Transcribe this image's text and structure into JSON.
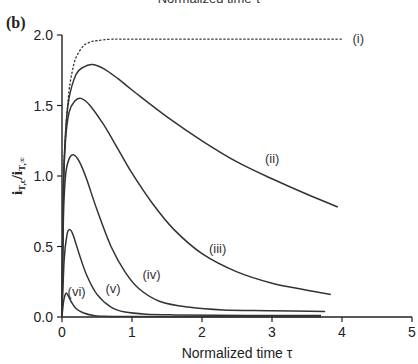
{
  "panel_label": "(b)",
  "top_cut_text": "Normalized time τ",
  "chart_data": {
    "type": "line",
    "title": "",
    "xlabel": "Normalized time τ",
    "ylabel": "i_T,c / i_T,∞",
    "xlim": [
      0,
      5
    ],
    "ylim": [
      0,
      2.0
    ],
    "xticks": [
      0,
      1,
      2,
      3,
      4,
      5
    ],
    "xtick_labels": [
      "0",
      "1",
      "2",
      "3",
      "4",
      "5"
    ],
    "yticks": [
      0.0,
      0.5,
      1.0,
      1.5,
      2.0
    ],
    "ytick_labels": [
      "0.0",
      "0.5",
      "1.0",
      "1.5",
      "2.0"
    ],
    "grid": false,
    "legend": "inline labels",
    "series": [
      {
        "name": "(i)",
        "style": "dotted",
        "x": [
          0,
          0.02,
          0.05,
          0.1,
          0.15,
          0.2,
          0.3,
          0.4,
          0.5,
          0.7,
          1.0,
          2.0,
          3.0,
          4.0
        ],
        "y": [
          0,
          0.9,
          1.3,
          1.6,
          1.75,
          1.84,
          1.92,
          1.95,
          1.96,
          1.97,
          1.97,
          1.97,
          1.97,
          1.97
        ],
        "label_pos": [
          4.15,
          1.97
        ]
      },
      {
        "name": "(ii)",
        "style": "solid",
        "x": [
          0,
          0.02,
          0.05,
          0.1,
          0.2,
          0.3,
          0.43,
          0.6,
          0.8,
          1.0,
          1.5,
          2.0,
          2.5,
          3.0,
          3.5,
          3.94
        ],
        "y": [
          0,
          0.9,
          1.3,
          1.55,
          1.72,
          1.77,
          1.79,
          1.76,
          1.69,
          1.61,
          1.42,
          1.25,
          1.1,
          0.98,
          0.87,
          0.78
        ],
        "label_pos": [
          2.9,
          1.12
        ]
      },
      {
        "name": "(iii)",
        "style": "solid",
        "x": [
          0,
          0.02,
          0.05,
          0.1,
          0.18,
          0.27,
          0.4,
          0.6,
          0.8,
          1.0,
          1.3,
          1.6,
          2.0,
          2.5,
          3.0,
          3.5,
          3.84
        ],
        "y": [
          0,
          0.9,
          1.25,
          1.45,
          1.53,
          1.55,
          1.5,
          1.36,
          1.19,
          1.02,
          0.8,
          0.62,
          0.45,
          0.32,
          0.24,
          0.19,
          0.16
        ],
        "label_pos": [
          2.1,
          0.48
        ]
      },
      {
        "name": "(iv)",
        "style": "solid",
        "x": [
          0,
          0.02,
          0.05,
          0.1,
          0.17,
          0.25,
          0.35,
          0.5,
          0.7,
          0.9,
          1.1,
          1.4,
          1.8,
          2.3,
          3.0,
          3.76
        ],
        "y": [
          0,
          0.7,
          1.0,
          1.12,
          1.15,
          1.1,
          0.98,
          0.76,
          0.5,
          0.32,
          0.2,
          0.11,
          0.07,
          0.05,
          0.045,
          0.04
        ],
        "label_pos": [
          1.15,
          0.3
        ]
      },
      {
        "name": "(v)",
        "style": "solid",
        "x": [
          0,
          0.03,
          0.07,
          0.11,
          0.16,
          0.25,
          0.35,
          0.5,
          0.7,
          0.9,
          1.2,
          1.6,
          2.2,
          3.0,
          3.7
        ],
        "y": [
          0,
          0.4,
          0.58,
          0.62,
          0.58,
          0.44,
          0.3,
          0.16,
          0.07,
          0.035,
          0.02,
          0.015,
          0.012,
          0.01,
          0.01
        ],
        "label_pos": [
          0.62,
          0.2
        ]
      },
      {
        "name": "(vi)",
        "style": "solid",
        "x": [
          0,
          0.02,
          0.04,
          0.06,
          0.09,
          0.13,
          0.2,
          0.3,
          0.45,
          0.6,
          1.0,
          2.0,
          3.0,
          3.7
        ],
        "y": [
          0,
          0.1,
          0.15,
          0.17,
          0.15,
          0.11,
          0.06,
          0.03,
          0.01,
          0.005,
          0.003,
          0.002,
          0.002,
          0.002
        ],
        "label_pos": [
          0.08,
          0.18
        ]
      }
    ]
  }
}
